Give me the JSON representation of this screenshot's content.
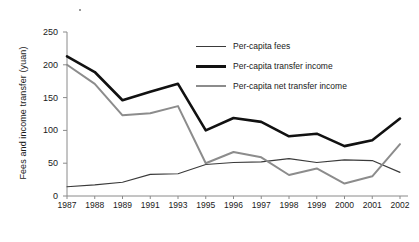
{
  "chart_data": {
    "type": "line",
    "title": "",
    "xlabel": "",
    "ylabel": "Fees and income transfer (yuan)",
    "categories": [
      "1987",
      "1988",
      "1989",
      "1991",
      "1993",
      "1995",
      "1996",
      "1997",
      "1998",
      "1999",
      "2000",
      "2001",
      "2002"
    ],
    "yticks": [
      0,
      50,
      100,
      150,
      200,
      250
    ],
    "ylim": [
      0,
      250
    ],
    "grid": false,
    "legend_position": "top-right",
    "series": [
      {
        "name": "Per-capita fees",
        "color": "#3a3a3a",
        "width": 1.1,
        "values": [
          14,
          17,
          21,
          33,
          34,
          48,
          51,
          52,
          57,
          51,
          55,
          54,
          36
        ]
      },
      {
        "name": "Per-capita transfer income",
        "color": "#111111",
        "width": 2.6,
        "values": [
          213,
          189,
          146,
          159,
          171,
          100,
          119,
          113,
          91,
          95,
          76,
          85,
          118
        ]
      },
      {
        "name": "Per-capita net transfer income",
        "color": "#8c8c8c",
        "width": 2.0,
        "values": [
          200,
          171,
          123,
          126,
          137,
          50,
          67,
          59,
          32,
          42,
          19,
          30,
          79
        ]
      }
    ]
  },
  "axis": {
    "y_title": "Fees and income transfer (yuan)",
    "y_labels": [
      "250",
      "200",
      "150",
      "100",
      "50",
      "0"
    ],
    "x_labels": [
      "1987",
      "1988",
      "1989",
      "1991",
      "1993",
      "1995",
      "1996",
      "1997",
      "1998",
      "1999",
      "2000",
      "2001",
      "2002"
    ]
  },
  "legend": {
    "items": [
      {
        "label": "Per-capita fees"
      },
      {
        "label": "Per-capita transfer income"
      },
      {
        "label": "Per-capita net transfer income"
      }
    ]
  }
}
